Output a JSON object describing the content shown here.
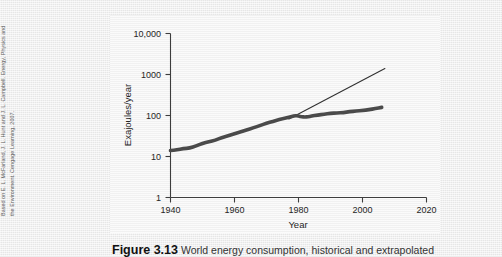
{
  "attribution": "Based on E. L. McFarland, J. L. Hunt and J. L. Campbell. Energy, Physics and\nthe Environment. Cengage Learning, 2007.",
  "caption": {
    "number": "Figure 3.13",
    "text": "World energy consumption, historical and extrapolated"
  },
  "chart_data": {
    "type": "line",
    "title": "",
    "xlabel": "Year",
    "ylabel": "Exajoules/year",
    "xlim": [
      1940,
      2025
    ],
    "ylim": [
      1,
      10000
    ],
    "yscale": "log",
    "xscale": "linear",
    "grid": false,
    "legend": "none",
    "xticks": [
      "1940",
      "1960",
      "1980",
      "2000",
      "2020"
    ],
    "xtick_values": [
      1940,
      1960,
      1980,
      2000,
      2020
    ],
    "yticks": [
      "1",
      "10",
      "100",
      "1000",
      "10,000"
    ],
    "ytick_values": [
      1,
      10,
      100,
      1000,
      10000
    ],
    "series": [
      {
        "name": "Historical world energy consumption",
        "style": "thick-line",
        "color": "#4a4a4a",
        "x": [
          1940,
          1942,
          1944,
          1946,
          1948,
          1950,
          1952,
          1954,
          1956,
          1958,
          1960,
          1962,
          1964,
          1966,
          1968,
          1970,
          1972,
          1974,
          1976,
          1978,
          1979,
          1980,
          1981,
          1982,
          1983,
          1984,
          1986,
          1988,
          1990,
          1992,
          1994,
          1996,
          1998,
          2000,
          2002,
          2004,
          2006
        ],
        "values": [
          14,
          14.5,
          15.5,
          16,
          18,
          21,
          23,
          25,
          29,
          32,
          36,
          40,
          45,
          50,
          57,
          65,
          72,
          80,
          86,
          95,
          100,
          96,
          93,
          92,
          93,
          97,
          102,
          108,
          113,
          115,
          118,
          124,
          128,
          133,
          138,
          148,
          158
        ]
      },
      {
        "name": "Exponential extrapolation",
        "style": "thin-line",
        "color": "#2f2f2f",
        "x": [
          1977,
          2007
        ],
        "values": [
          82,
          1400
        ]
      }
    ]
  }
}
